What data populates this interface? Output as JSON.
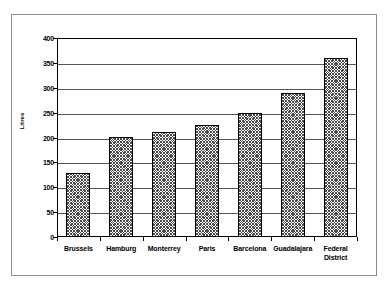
{
  "chart_data": {
    "type": "bar",
    "title": "",
    "subtitle": "",
    "xlabel": "",
    "ylabel": "Litres",
    "categories": [
      "Brussels",
      "Hamburg",
      "Monterrey",
      "Paris",
      "Barcelona",
      "Guadalajara",
      "Federal District"
    ],
    "values": [
      128,
      202,
      211,
      225,
      250,
      290,
      359
    ],
    "ylim": [
      0,
      400
    ],
    "ytick_labels": [
      "400",
      "350",
      "300",
      "250",
      "200",
      "150",
      "100",
      "50",
      "0"
    ],
    "ytick_values": [
      400,
      350,
      300,
      250,
      200,
      150,
      100,
      50,
      0
    ],
    "grid": true,
    "grid_axis": "y",
    "legend": false,
    "legend_position": "none",
    "series": [
      {
        "name": "Litres",
        "values": [
          128,
          202,
          211,
          225,
          250,
          290,
          359
        ],
        "fill": "cross-hatch",
        "color": "#4a4a4a",
        "edge_color": "#000000"
      }
    ],
    "category_labels_wrapped": {
      "Federal District": [
        "Federal",
        "District"
      ]
    }
  },
  "figure": {
    "background": "#ffffff",
    "border_color": "#8c8c93",
    "axis_color": "#000000",
    "gridline_color": "#555555"
  }
}
